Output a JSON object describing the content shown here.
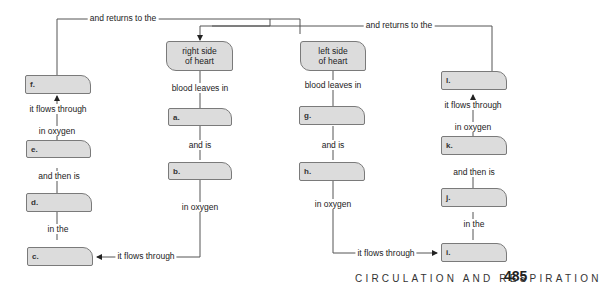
{
  "diagram": {
    "type": "concept-map",
    "boxes": {
      "right_heart": "right side\nof heart",
      "left_heart": "left side\nof heart",
      "a": "a.",
      "b": "b.",
      "c": "c.",
      "d": "d.",
      "e": "e.",
      "f": "f.",
      "g": "g.",
      "h": "h.",
      "i": "i.",
      "j": "j.",
      "k": "k.",
      "l": "l."
    },
    "links": {
      "returns_left": "and returns to the",
      "returns_right": "and returns to the",
      "blood_leaves_right": "blood leaves in",
      "blood_leaves_left": "blood leaves in",
      "and_is_right": "and is",
      "and_is_left": "and is",
      "in_oxygen_b": "in oxygen",
      "in_oxygen_h": "in oxygen",
      "flows_c": "it flows through",
      "flows_i": "it flows through",
      "in_the_left": "in the",
      "in_the_right": "in the",
      "then_is_left": "and then is",
      "then_is_right": "and then is",
      "in_oxygen_e": "in oxygen",
      "in_oxygen_k": "in oxygen",
      "flows_f": "it flows through",
      "flows_l": "it flows through"
    }
  },
  "footer": {
    "section_title": "CIRCULATION AND RESPIRATION",
    "page_number": "485"
  }
}
